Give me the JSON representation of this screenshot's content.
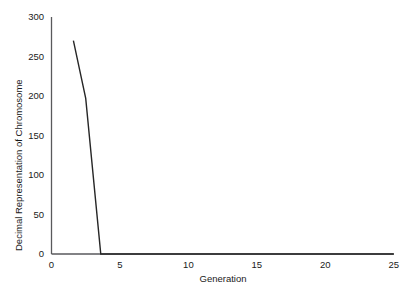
{
  "chart_data": {
    "type": "line",
    "title": "",
    "xlabel": "Generation",
    "ylabel": "Decimal Representation of Chromosome",
    "xlim": [
      0,
      25
    ],
    "ylim": [
      0,
      300
    ],
    "xticks": [
      "0",
      "5",
      "10",
      "15",
      "20",
      "25"
    ],
    "yticks": [
      "0",
      "50",
      "100",
      "150",
      "200",
      "250",
      "300"
    ],
    "xtick_values": [
      0,
      5,
      10,
      15,
      20,
      25
    ],
    "ytick_values": [
      0,
      50,
      100,
      150,
      200,
      250,
      300
    ],
    "grid": false,
    "legend": null,
    "series": [
      {
        "name": "Best chromosome value",
        "color": "#262626",
        "x": [
          1.6,
          2.5,
          3.6,
          25
        ],
        "values": [
          270,
          197,
          0,
          0
        ]
      }
    ],
    "annotations": []
  },
  "axes": {
    "line_color": "#59595c",
    "tick_text_color": "#1a1a1a"
  }
}
